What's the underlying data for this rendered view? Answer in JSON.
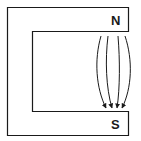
{
  "diagram": {
    "poles": [
      {
        "label": "N",
        "position": "top"
      },
      {
        "label": "S",
        "position": "bottom"
      }
    ],
    "field_line_count": 4,
    "field_direction": "N to S",
    "colors": {
      "stroke": "#1a1a1a",
      "background": "#ffffff"
    }
  }
}
